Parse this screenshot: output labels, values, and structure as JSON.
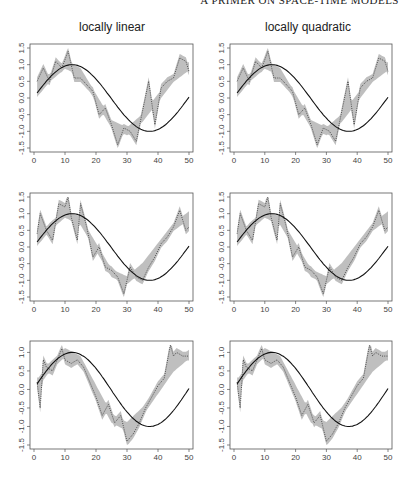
{
  "header": {
    "running_title": "A PRIMER ON SPACE-TIME MODELS"
  },
  "columns": [
    {
      "title": "locally linear"
    },
    {
      "title": "locally quadratic"
    }
  ],
  "chart_data": [
    {
      "type": "line",
      "row": 1,
      "column": "locally linear",
      "title": "locally linear",
      "xlabel": "",
      "ylabel": "",
      "xlim": [
        0,
        50
      ],
      "ylim": [
        -1.5,
        1.5
      ],
      "xticks": [
        0,
        10,
        20,
        30,
        40,
        50
      ],
      "yticks": [
        -1.5,
        -1.0,
        -0.5,
        0.0,
        0.5,
        1.0,
        1.5
      ],
      "series": [
        {
          "name": "true function",
          "style": "solid",
          "x": [
            1,
            5,
            10,
            15,
            20,
            25,
            30,
            35,
            40,
            45,
            50
          ],
          "values": [
            0.15,
            0.6,
            1.0,
            0.78,
            0.0,
            -0.78,
            -1.0,
            -0.6,
            0.0,
            0.6,
            0.95
          ]
        },
        {
          "name": "noisy data / local estimate",
          "style": "dotted",
          "x": [
            1,
            3,
            5,
            7,
            9,
            11,
            13,
            15,
            17,
            19,
            21,
            23,
            25,
            27,
            29,
            31,
            33,
            35,
            37,
            39,
            41,
            43,
            45,
            47,
            49,
            50
          ],
          "values": [
            0.5,
            0.9,
            0.5,
            1.1,
            0.9,
            1.4,
            0.6,
            0.6,
            0.4,
            0.2,
            -0.5,
            -0.3,
            -0.8,
            -1.4,
            -0.9,
            -1.0,
            -1.3,
            -0.4,
            0.5,
            -0.8,
            0.3,
            0.5,
            0.6,
            1.2,
            1.1,
            0.8
          ]
        },
        {
          "name": "confidence band",
          "style": "shaded",
          "x": [
            1,
            10,
            20,
            30,
            40,
            50
          ],
          "lower": [
            0.3,
            0.8,
            -0.3,
            -1.2,
            -0.3,
            0.8
          ],
          "upper": [
            0.8,
            1.1,
            0.2,
            -0.8,
            0.3,
            1.2
          ]
        }
      ],
      "grid": false,
      "legend": "none"
    },
    {
      "type": "line",
      "row": 1,
      "column": "locally quadratic",
      "title": "locally quadratic",
      "xlim": [
        0,
        50
      ],
      "ylim": [
        -1.5,
        1.5
      ],
      "xticks": [
        0,
        10,
        20,
        30,
        40,
        50
      ],
      "yticks": [
        -1.5,
        -1.0,
        -0.5,
        0.0,
        0.5,
        1.0,
        1.5
      ],
      "series": [
        {
          "name": "true function",
          "style": "solid",
          "x": [
            1,
            5,
            10,
            15,
            20,
            25,
            30,
            35,
            40,
            45,
            50
          ],
          "values": [
            0.15,
            0.6,
            1.0,
            0.78,
            0.0,
            -0.78,
            -1.0,
            -0.6,
            0.0,
            0.6,
            0.95
          ]
        },
        {
          "name": "noisy data / local estimate",
          "style": "dotted",
          "x": [
            1,
            3,
            5,
            7,
            9,
            11,
            13,
            15,
            17,
            19,
            21,
            23,
            25,
            27,
            29,
            31,
            33,
            35,
            37,
            39,
            41,
            43,
            45,
            47,
            49,
            50
          ],
          "values": [
            0.5,
            0.9,
            0.5,
            1.1,
            0.9,
            1.4,
            0.6,
            0.6,
            0.4,
            0.2,
            -0.5,
            -0.3,
            -0.8,
            -1.4,
            -0.9,
            -1.0,
            -1.3,
            -0.4,
            0.5,
            -0.8,
            0.3,
            0.5,
            0.6,
            1.2,
            1.1,
            0.8
          ]
        },
        {
          "name": "confidence band",
          "style": "shaded",
          "x": [
            1,
            10,
            20,
            30,
            40,
            50
          ],
          "lower": [
            0.4,
            0.8,
            -0.3,
            -1.2,
            -0.3,
            0.8
          ],
          "upper": [
            0.8,
            1.15,
            0.2,
            -0.8,
            0.3,
            1.1
          ]
        }
      ],
      "grid": false,
      "legend": "none"
    },
    {
      "type": "line",
      "row": 2,
      "column": "locally linear",
      "xlim": [
        0,
        50
      ],
      "ylim": [
        -1.5,
        1.5
      ],
      "xticks": [
        0,
        10,
        20,
        30,
        40,
        50
      ],
      "yticks": [
        -1.5,
        -1.0,
        -0.5,
        0.0,
        0.5,
        1.0,
        1.5
      ],
      "series": [
        {
          "name": "true function",
          "style": "solid",
          "x": [
            1,
            5,
            10,
            15,
            20,
            25,
            30,
            35,
            40,
            45,
            50
          ],
          "values": [
            0.15,
            0.6,
            1.0,
            0.78,
            0.0,
            -0.78,
            -1.0,
            -0.6,
            0.0,
            0.6,
            0.95
          ]
        },
        {
          "name": "noisy data / local estimate",
          "style": "dotted",
          "x": [
            1,
            2,
            4,
            6,
            8,
            10,
            11,
            12,
            14,
            15,
            17,
            19,
            21,
            23,
            25,
            27,
            29,
            31,
            33,
            35,
            37,
            39,
            41,
            43,
            45,
            47,
            49,
            50
          ],
          "values": [
            0.4,
            1.0,
            0.5,
            0.2,
            1.3,
            1.2,
            1.5,
            0.9,
            0.2,
            1.3,
            0.6,
            -0.3,
            0.0,
            -0.6,
            -0.7,
            -0.9,
            -1.4,
            -0.6,
            -0.9,
            -1.0,
            -0.6,
            -0.3,
            0.1,
            0.3,
            0.6,
            1.1,
            0.5,
            0.6
          ]
        },
        {
          "name": "confidence band",
          "style": "shaded",
          "x": [
            1,
            10,
            20,
            30,
            40,
            50
          ],
          "lower": [
            0.3,
            0.9,
            -0.3,
            -1.2,
            -0.2,
            0.6
          ],
          "upper": [
            0.8,
            1.2,
            0.2,
            -0.7,
            0.3,
            1.0
          ]
        }
      ],
      "grid": false,
      "legend": "none"
    },
    {
      "type": "line",
      "row": 2,
      "column": "locally quadratic",
      "xlim": [
        0,
        50
      ],
      "ylim": [
        -1.5,
        1.5
      ],
      "xticks": [
        0,
        10,
        20,
        30,
        40,
        50
      ],
      "yticks": [
        -1.5,
        -1.0,
        -0.5,
        0.0,
        0.5,
        1.0,
        1.5
      ],
      "series": [
        {
          "name": "true function",
          "style": "solid",
          "x": [
            1,
            5,
            10,
            15,
            20,
            25,
            30,
            35,
            40,
            45,
            50
          ],
          "values": [
            0.15,
            0.6,
            1.0,
            0.78,
            0.0,
            -0.78,
            -1.0,
            -0.6,
            0.0,
            0.6,
            0.95
          ]
        },
        {
          "name": "noisy data / local estimate",
          "style": "dotted",
          "x": [
            1,
            2,
            4,
            6,
            8,
            10,
            11,
            12,
            14,
            15,
            17,
            19,
            21,
            23,
            25,
            27,
            29,
            31,
            33,
            35,
            37,
            39,
            41,
            43,
            45,
            47,
            49,
            50
          ],
          "values": [
            0.4,
            1.0,
            0.5,
            0.2,
            1.3,
            1.2,
            1.5,
            0.9,
            0.2,
            1.3,
            0.6,
            -0.3,
            0.0,
            -0.6,
            -0.7,
            -0.9,
            -1.4,
            -0.6,
            -0.9,
            -1.0,
            -0.6,
            -0.3,
            0.1,
            0.3,
            0.6,
            1.1,
            0.5,
            0.6
          ]
        },
        {
          "name": "confidence band",
          "style": "shaded",
          "x": [
            1,
            10,
            20,
            30,
            40,
            50
          ],
          "lower": [
            0.3,
            0.9,
            -0.3,
            -1.2,
            -0.2,
            0.6
          ],
          "upper": [
            0.8,
            1.2,
            0.2,
            -0.7,
            0.3,
            1.0
          ]
        }
      ],
      "grid": false,
      "legend": "none"
    },
    {
      "type": "line",
      "row": 3,
      "column": "locally linear",
      "xlim": [
        0,
        50
      ],
      "ylim": [
        -1.5,
        1.2
      ],
      "xticks": [
        0,
        10,
        20,
        30,
        40,
        50
      ],
      "yticks": [
        -1.5,
        -1.0,
        -0.5,
        0.0,
        0.5,
        1.0
      ],
      "series": [
        {
          "name": "true function",
          "style": "solid",
          "x": [
            1,
            5,
            10,
            15,
            20,
            25,
            30,
            35,
            40,
            45,
            50
          ],
          "values": [
            0.15,
            0.6,
            1.0,
            0.78,
            0.0,
            -0.78,
            -1.0,
            -0.6,
            0.0,
            0.6,
            0.95
          ]
        },
        {
          "name": "noisy data / local estimate",
          "style": "dotted",
          "x": [
            1,
            2,
            3,
            4,
            6,
            8,
            9,
            10,
            12,
            14,
            16,
            18,
            20,
            22,
            24,
            26,
            28,
            30,
            32,
            34,
            36,
            38,
            40,
            42,
            44,
            45,
            46,
            48,
            50
          ],
          "values": [
            0.2,
            -0.5,
            0.8,
            0.6,
            0.5,
            0.9,
            1.1,
            0.8,
            0.7,
            0.8,
            0.6,
            0.2,
            -0.2,
            -0.7,
            -0.4,
            -0.9,
            -0.7,
            -1.4,
            -1.2,
            -0.9,
            -0.5,
            -0.2,
            0.1,
            0.3,
            1.2,
            0.9,
            1.0,
            0.9,
            0.9
          ]
        },
        {
          "name": "confidence band",
          "style": "shaded",
          "x": [
            1,
            10,
            20,
            30,
            40,
            50
          ],
          "lower": [
            0.1,
            0.6,
            -0.3,
            -1.3,
            -0.1,
            0.7
          ],
          "upper": [
            0.4,
            1.0,
            0.1,
            -0.9,
            0.2,
            1.0
          ]
        }
      ],
      "grid": false,
      "legend": "none"
    },
    {
      "type": "line",
      "row": 3,
      "column": "locally quadratic",
      "xlim": [
        0,
        50
      ],
      "ylim": [
        -1.5,
        1.2
      ],
      "xticks": [
        0,
        10,
        20,
        30,
        40,
        50
      ],
      "yticks": [
        -1.5,
        -1.0,
        -0.5,
        0.0,
        0.5,
        1.0
      ],
      "series": [
        {
          "name": "true function",
          "style": "solid",
          "x": [
            1,
            5,
            10,
            15,
            20,
            25,
            30,
            35,
            40,
            45,
            50
          ],
          "values": [
            0.15,
            0.6,
            1.0,
            0.78,
            0.0,
            -0.78,
            -1.0,
            -0.6,
            0.0,
            0.6,
            0.95
          ]
        },
        {
          "name": "noisy data / local estimate",
          "style": "dotted",
          "x": [
            1,
            2,
            3,
            4,
            6,
            8,
            9,
            10,
            12,
            14,
            16,
            18,
            20,
            22,
            24,
            26,
            28,
            30,
            32,
            34,
            36,
            38,
            40,
            42,
            44,
            45,
            46,
            48,
            50
          ],
          "values": [
            0.2,
            -0.5,
            0.8,
            0.6,
            0.5,
            0.9,
            1.1,
            0.8,
            0.7,
            0.8,
            0.6,
            0.2,
            -0.2,
            -0.7,
            -0.4,
            -0.9,
            -0.7,
            -1.4,
            -1.2,
            -0.9,
            -0.5,
            -0.2,
            0.1,
            0.3,
            1.2,
            0.9,
            1.0,
            0.9,
            0.9
          ]
        },
        {
          "name": "confidence band",
          "style": "shaded",
          "x": [
            1,
            10,
            20,
            30,
            40,
            50
          ],
          "lower": [
            0.1,
            0.6,
            -0.3,
            -1.3,
            -0.1,
            0.7
          ],
          "upper": [
            0.4,
            1.0,
            0.1,
            -0.9,
            0.2,
            1.0
          ]
        }
      ],
      "grid": false,
      "legend": "none"
    }
  ]
}
